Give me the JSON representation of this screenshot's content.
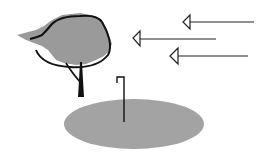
{
  "diagram": {
    "colors": {
      "background": "#ffffff",
      "canopy_fill": "#9a9a9a",
      "ground_fill": "#a3a3a3",
      "outline": "#111111",
      "arrow": "#222222"
    },
    "elements": {
      "tree": {
        "label": "tree"
      },
      "ground": {
        "label": "ground-ellipse"
      },
      "stake": {
        "label": "hooked-stake"
      },
      "arrows": [
        {
          "label": "arrow-top"
        },
        {
          "label": "arrow-middle"
        },
        {
          "label": "arrow-bottom"
        }
      ]
    }
  }
}
